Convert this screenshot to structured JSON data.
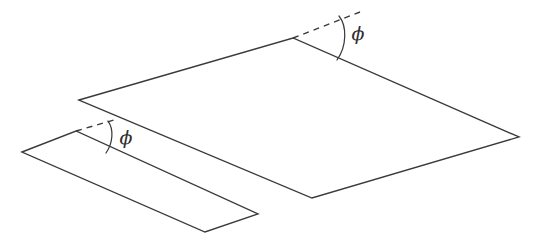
{
  "figure": {
    "background_color": "#ffffff",
    "stroke_color": "#3a3a3c",
    "label_color": "#2e2e30",
    "width": 533,
    "height": 240
  },
  "shapes": {
    "large_plane": {
      "name": "large inclined plane",
      "points": "79,100 293,38 519,137 312,198",
      "vertices": {
        "left": [
          79,
          100
        ],
        "top": [
          293,
          38
        ],
        "right": [
          519,
          137
        ],
        "bottom": [
          312,
          198
        ]
      }
    },
    "small_plane": {
      "name": "small inclined strip",
      "points": "22,152 76,131 258,214 205,232",
      "vertices": {
        "left": [
          22,
          152
        ],
        "top": [
          76,
          131
        ],
        "right": [
          258,
          214
        ],
        "bottom": [
          205,
          232
        ]
      }
    }
  },
  "annotations": {
    "upper": {
      "label": "ϕ",
      "label_x": 358,
      "label_y": 35,
      "dashed_line": "M293,38 L360,12",
      "arc_path": "M339,16 C347,26 347,46 337,60",
      "vertex": [
        293,
        38
      ]
    },
    "lower": {
      "label": "ϕ",
      "label_x": 126,
      "label_y": 139,
      "dashed_line": "M76,131 L114,120",
      "arc_path": "M108,121 C114,129 113,143 106,153",
      "vertex": [
        76,
        131
      ]
    }
  }
}
